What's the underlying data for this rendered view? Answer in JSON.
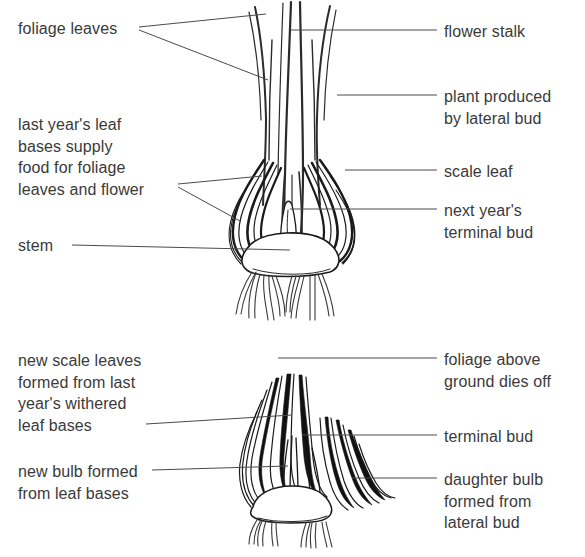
{
  "figure": {
    "background_color": "#ffffff",
    "ink_color": "#1a1a1a",
    "text_color": "#3a3a3a"
  },
  "top_panel": {
    "name": "growing-bulb-in-flower",
    "labels_left": [
      {
        "id": "foliage-leaves",
        "text": "foliage leaves"
      },
      {
        "id": "last-years-leaf-bases",
        "text": "last year's leaf\nbases supply\nfood for foliage\nleaves and flower"
      },
      {
        "id": "stem",
        "text": "stem"
      }
    ],
    "labels_right": [
      {
        "id": "flower-stalk",
        "text": "flower stalk"
      },
      {
        "id": "plant-produced-by-lateral-bud",
        "text": "plant produced\nby lateral bud"
      },
      {
        "id": "scale-leaf",
        "text": "scale leaf"
      },
      {
        "id": "next-years-terminal-bud",
        "text": "next year's\nterminal bud"
      }
    ]
  },
  "bottom_panel": {
    "name": "dormant-bulb-with-daughter-bulb",
    "labels_left": [
      {
        "id": "new-scale-leaves",
        "text": "new scale leaves\nformed from last\nyear's withered\nleaf bases"
      },
      {
        "id": "new-bulb-formed",
        "text": "new bulb formed\nfrom leaf bases"
      }
    ],
    "labels_right": [
      {
        "id": "foliage-above-ground-dies-off",
        "text": "foliage above\nground dies off"
      },
      {
        "id": "terminal-bud",
        "text": "terminal bud"
      },
      {
        "id": "daughter-bulb",
        "text": "daughter bulb\nformed from\nlateral bud"
      }
    ]
  }
}
